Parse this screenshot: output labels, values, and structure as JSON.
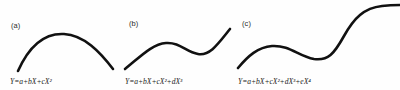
{
  "figure": {
    "background_color": "#fefefe",
    "stroke_color": "#111111",
    "panels": [
      {
        "id": "a",
        "label": "(a)",
        "formula": "Y=a+bX+cX²",
        "curve_name": "quadratic-curve",
        "description": "downward-opening parabola arc"
      },
      {
        "id": "b",
        "label": "(b)",
        "formula": "Y=a+bX+cX²+dX³",
        "curve_name": "cubic-curve",
        "description": "S-shaped cubic with one local maximum and one local minimum"
      },
      {
        "id": "c",
        "label": "(c)",
        "formula": "Y=a+bX+cX²+dX³+eX⁴",
        "curve_name": "quartic-curve",
        "description": "quartic wave rising to plateau, dipping, then rising steeply"
      }
    ]
  },
  "chart_data": {
    "type": "line",
    "title": "",
    "xlabel": "",
    "ylabel": "",
    "grid": false,
    "legend": "none",
    "panels": [
      {
        "label": "(a)",
        "equation": "Y=a+bX+cX²",
        "degree": 2,
        "terms": [
          "a",
          "bX",
          "cX²"
        ],
        "path": "M 18 71 C 30 44, 46 33, 64 34 C 84 35, 100 52, 113 69"
      },
      {
        "label": "(b)",
        "equation": "Y=a+bX+cX²+dX³",
        "degree": 3,
        "terms": [
          "a",
          "bX",
          "cX²",
          "dX³"
        ],
        "path": "M 7 69 C 22 57, 34 44, 48 43 C 62 42, 68 52, 80 54 C 92 56, 100 44, 112 29"
      },
      {
        "label": "(c)",
        "equation": "Y=a+bX+cX²+dX³+eX⁴",
        "degree": 4,
        "terms": [
          "a",
          "bX",
          "cX²",
          "dX³",
          "eX⁴"
        ],
        "path": "M 2 68 C 12 56, 22 47, 36 46 C 54 45, 62 56, 78 59 C 92 61, 98 54, 108 36 C 118 18, 128 8, 146 6 C 154 5, 160 5, 164 5"
      }
    ]
  }
}
